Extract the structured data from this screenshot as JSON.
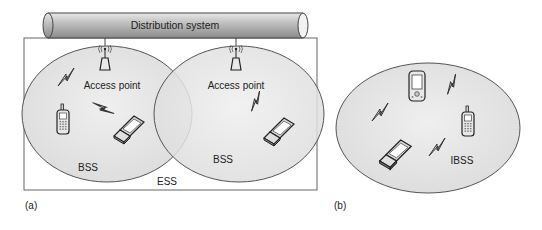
{
  "panel_a": {
    "label": "(a)",
    "distribution_system": "Distribution system",
    "ess_label": "ESS",
    "bss": [
      {
        "access_point_label": "Access point",
        "bss_label": "BSS"
      },
      {
        "access_point_label": "Access point",
        "bss_label": "BSS"
      }
    ]
  },
  "panel_b": {
    "label": "(b)",
    "ibss_label": "IBSS"
  },
  "colors": {
    "cell_fill": "#e6e6e6",
    "cell_stroke": "#555555",
    "pipe_fill": "#b5b5b5",
    "box_stroke": "#666666"
  }
}
